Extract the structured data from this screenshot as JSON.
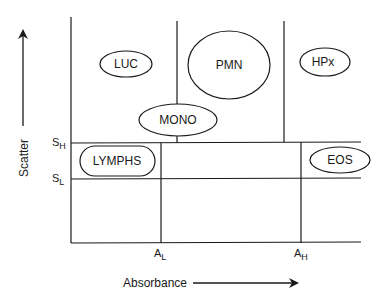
{
  "diagram": {
    "type": "cell-cytogram-threshold-map",
    "y_axis": {
      "label": "Scatter",
      "direction": "up"
    },
    "x_axis": {
      "label": "Absorbance",
      "direction": "right"
    },
    "y_thresholds": [
      {
        "main": "S",
        "sub": "H"
      },
      {
        "main": "S",
        "sub": "L"
      }
    ],
    "x_thresholds": [
      {
        "main": "A",
        "sub": "L"
      },
      {
        "main": "A",
        "sub": "H"
      }
    ],
    "regions": [
      {
        "id": "luc",
        "label": "LUC",
        "shape": "ellipse"
      },
      {
        "id": "pmn",
        "label": "PMN",
        "shape": "ellipse"
      },
      {
        "id": "hpx",
        "label": "HPx",
        "shape": "ellipse"
      },
      {
        "id": "mono",
        "label": "MONO",
        "shape": "ellipse"
      },
      {
        "id": "lymphs",
        "label": "LYMPHS",
        "shape": "rounded-rect"
      },
      {
        "id": "eos",
        "label": "EOS",
        "shape": "ellipse"
      }
    ],
    "line_color": "#1a1a1a",
    "background": "#ffffff"
  }
}
